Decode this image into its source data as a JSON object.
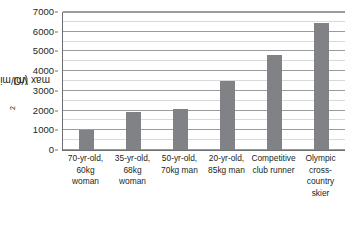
{
  "chart_data": {
    "type": "bar",
    "title": "",
    "xlabel": "",
    "ylabel": "VO2max (ml/min)",
    "ylabel_parts": {
      "pre": "VO",
      "sub": "2",
      "post": "max (ml/min)"
    },
    "ylim": [
      0,
      7000
    ],
    "ytick_step": 1000,
    "yminor_step": 500,
    "grid": true,
    "legend": "none",
    "bar_color": "#808285",
    "gridline_major_color": "#9a9b9d",
    "gridline_minor_color": "#d8d9da",
    "axis_color": "#6d6e71",
    "ytick_labels": [
      "0",
      "1000",
      "2000",
      "3000",
      "4000",
      "5000",
      "6000",
      "7000"
    ],
    "ytick_values": [
      0,
      1000,
      2000,
      3000,
      4000,
      5000,
      6000,
      7000
    ],
    "categories": [
      "70-yr-old, 60kg woman",
      "35-yr-old, 68kg woman",
      "50-yr-old, 70kg man",
      "20-yr-old, 85kg man",
      "Competitive club runner",
      "Olympic cross-country skier"
    ],
    "category_lines": [
      [
        "70-yr-old,",
        "60kg",
        "woman"
      ],
      [
        "35-yr-old,",
        "68kg",
        "woman"
      ],
      [
        "50-yr-old,",
        "70kg man"
      ],
      [
        "20-yr-old,",
        "85kg man"
      ],
      [
        "Competitive",
        "club runner"
      ],
      [
        "Olympic",
        "cross-",
        "country",
        "skier"
      ]
    ],
    "values": [
      1000,
      1950,
      2100,
      3500,
      4800,
      6450
    ]
  }
}
